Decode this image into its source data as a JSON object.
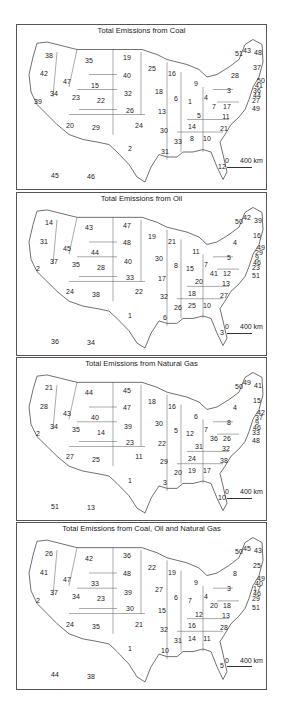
{
  "figure": {
    "panels": [
      {
        "title": "Total Emissions from Coal",
        "scale_label_zero": "0",
        "scale_label": "400 km",
        "states": {
          "WA": 38,
          "OR": 42,
          "CA": 39,
          "ID": 47,
          "NV": 34,
          "MT": 35,
          "WY": 15,
          "UT": 23,
          "AZ": 20,
          "CO": 22,
          "NM": 29,
          "ND": 19,
          "SD": 40,
          "NE": 32,
          "KS": 26,
          "OK": 24,
          "TX": 2,
          "MN": 25,
          "IA": 18,
          "MO": 13,
          "AR": 30,
          "LA": 31,
          "WI": 16,
          "IL": 6,
          "MI": 9,
          "IN": 1,
          "OH": 4,
          "KY": 5,
          "TN": 14,
          "MS": 33,
          "AL": 8,
          "GA": 10,
          "FL": 12,
          "SC": 21,
          "NC": 11,
          "VA": 17,
          "WV": 7,
          "PA": 3,
          "NY": 28,
          "ME": 48,
          "NH": 43,
          "VT": 51,
          "MA": 37,
          "RI": 50,
          "CT": 41,
          "NJ": 36,
          "DE": 44,
          "MD": 27,
          "DC": 49,
          "AK": 46,
          "HI": 45
        }
      },
      {
        "title": "Total Emissions from Oil",
        "scale_label_zero": "0",
        "scale_label": "400 km",
        "states": {
          "WA": 14,
          "OR": 31,
          "CA": 2,
          "ID": 45,
          "NV": 37,
          "MT": 43,
          "WY": 44,
          "UT": 35,
          "AZ": 24,
          "CO": 28,
          "NM": 38,
          "ND": 47,
          "SD": 48,
          "NE": 40,
          "KS": 33,
          "OK": 22,
          "TX": 1,
          "MN": 19,
          "IA": 30,
          "MO": 17,
          "AR": 32,
          "LA": 6,
          "WI": 21,
          "IL": 8,
          "MI": 11,
          "IN": 15,
          "OH": 7,
          "KY": 20,
          "TN": 18,
          "MS": 26,
          "AL": 25,
          "GA": 10,
          "FL": 3,
          "SC": 27,
          "NC": 13,
          "VA": 12,
          "WV": 41,
          "PA": 5,
          "NY": 4,
          "ME": 39,
          "NH": 42,
          "VT": 50,
          "MA": 16,
          "RI": 49,
          "CT": 29,
          "NJ": 9,
          "DE": 46,
          "MD": 23,
          "DC": 51,
          "AK": 34,
          "HI": 36
        }
      },
      {
        "title": "Total Emissions from Natural Gas",
        "scale_label_zero": "0",
        "scale_label": "400 km",
        "states": {
          "WA": 21,
          "OR": 28,
          "CA": 2,
          "ID": 43,
          "NV": 34,
          "MT": 44,
          "WY": 40,
          "UT": 35,
          "AZ": 27,
          "CO": 14,
          "NM": 25,
          "ND": 45,
          "SD": 47,
          "NE": 39,
          "KS": 23,
          "OK": 11,
          "TX": 1,
          "MN": 18,
          "IA": 30,
          "MO": 22,
          "AR": 29,
          "LA": 3,
          "WI": 16,
          "IL": 5,
          "MI": 6,
          "IN": 12,
          "OH": 7,
          "KY": 31,
          "TN": 24,
          "MS": 20,
          "AL": 19,
          "GA": 17,
          "FL": 10,
          "SC": 38,
          "NC": 32,
          "VA": 26,
          "WV": 36,
          "PA": 8,
          "NY": 4,
          "ME": 41,
          "NH": 49,
          "VT": 50,
          "MA": 15,
          "RI": 42,
          "CT": 37,
          "NJ": 9,
          "DE": 46,
          "MD": 33,
          "DC": 48,
          "AK": 13,
          "HI": 51
        }
      },
      {
        "title": "Total Emissions from Coal, Oil and Natural Gas",
        "scale_label_zero": "0",
        "scale_label": "400 km",
        "states": {
          "WA": 26,
          "OR": 41,
          "CA": 2,
          "ID": 47,
          "NV": 37,
          "MT": 42,
          "WY": 33,
          "UT": 34,
          "AZ": 24,
          "CO": 23,
          "NM": 35,
          "ND": 36,
          "SD": 48,
          "NE": 39,
          "KS": 30,
          "OK": 21,
          "TX": 1,
          "MN": 22,
          "IA": 27,
          "MO": 15,
          "AR": 32,
          "LA": 10,
          "WI": 19,
          "IL": 6,
          "MI": 9,
          "IN": 7,
          "OH": 4,
          "KY": 12,
          "TN": 16,
          "MS": 31,
          "AL": 14,
          "GA": 11,
          "FL": 5,
          "SC": 28,
          "NC": 13,
          "VA": 18,
          "WV": 20,
          "PA": 3,
          "NY": 8,
          "ME": 43,
          "NH": 45,
          "VT": 50,
          "MA": 25,
          "RI": 49,
          "CT": 40,
          "NJ": 17,
          "DE": 46,
          "MD": 29,
          "DC": 51,
          "AK": 38,
          "HI": 44
        }
      }
    ]
  }
}
